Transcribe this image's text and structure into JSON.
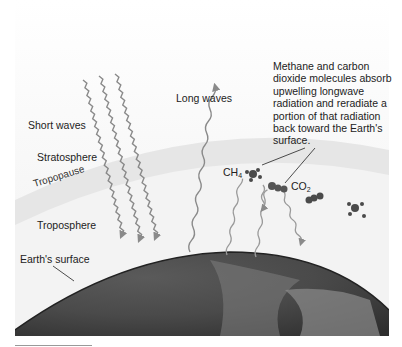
{
  "labels": {
    "short_waves": "Short waves",
    "long_waves": "Long waves",
    "stratosphere": "Stratosphere",
    "tropopause": "Tropopause",
    "troposphere": "Troposphere",
    "earths_surface": "Earth's surface",
    "ch4_base": "CH",
    "ch4_sub": "4",
    "co2_base": "CO",
    "co2_sub": "2"
  },
  "callout": {
    "text": "Methane and carbon dioxide molecules absorb upwelling longwave radiation and reradiate a portion of that radiation back toward the Earth's surface."
  },
  "colors": {
    "background": "#ffffff",
    "sky": "#f4f4f4",
    "atmosphere_band": "#e4e4e4",
    "earth_dark": "#3a3a3a",
    "earth_light": "#9a9a9a",
    "wave": "#8a8a8a",
    "molecule": "#4a4a4a"
  }
}
